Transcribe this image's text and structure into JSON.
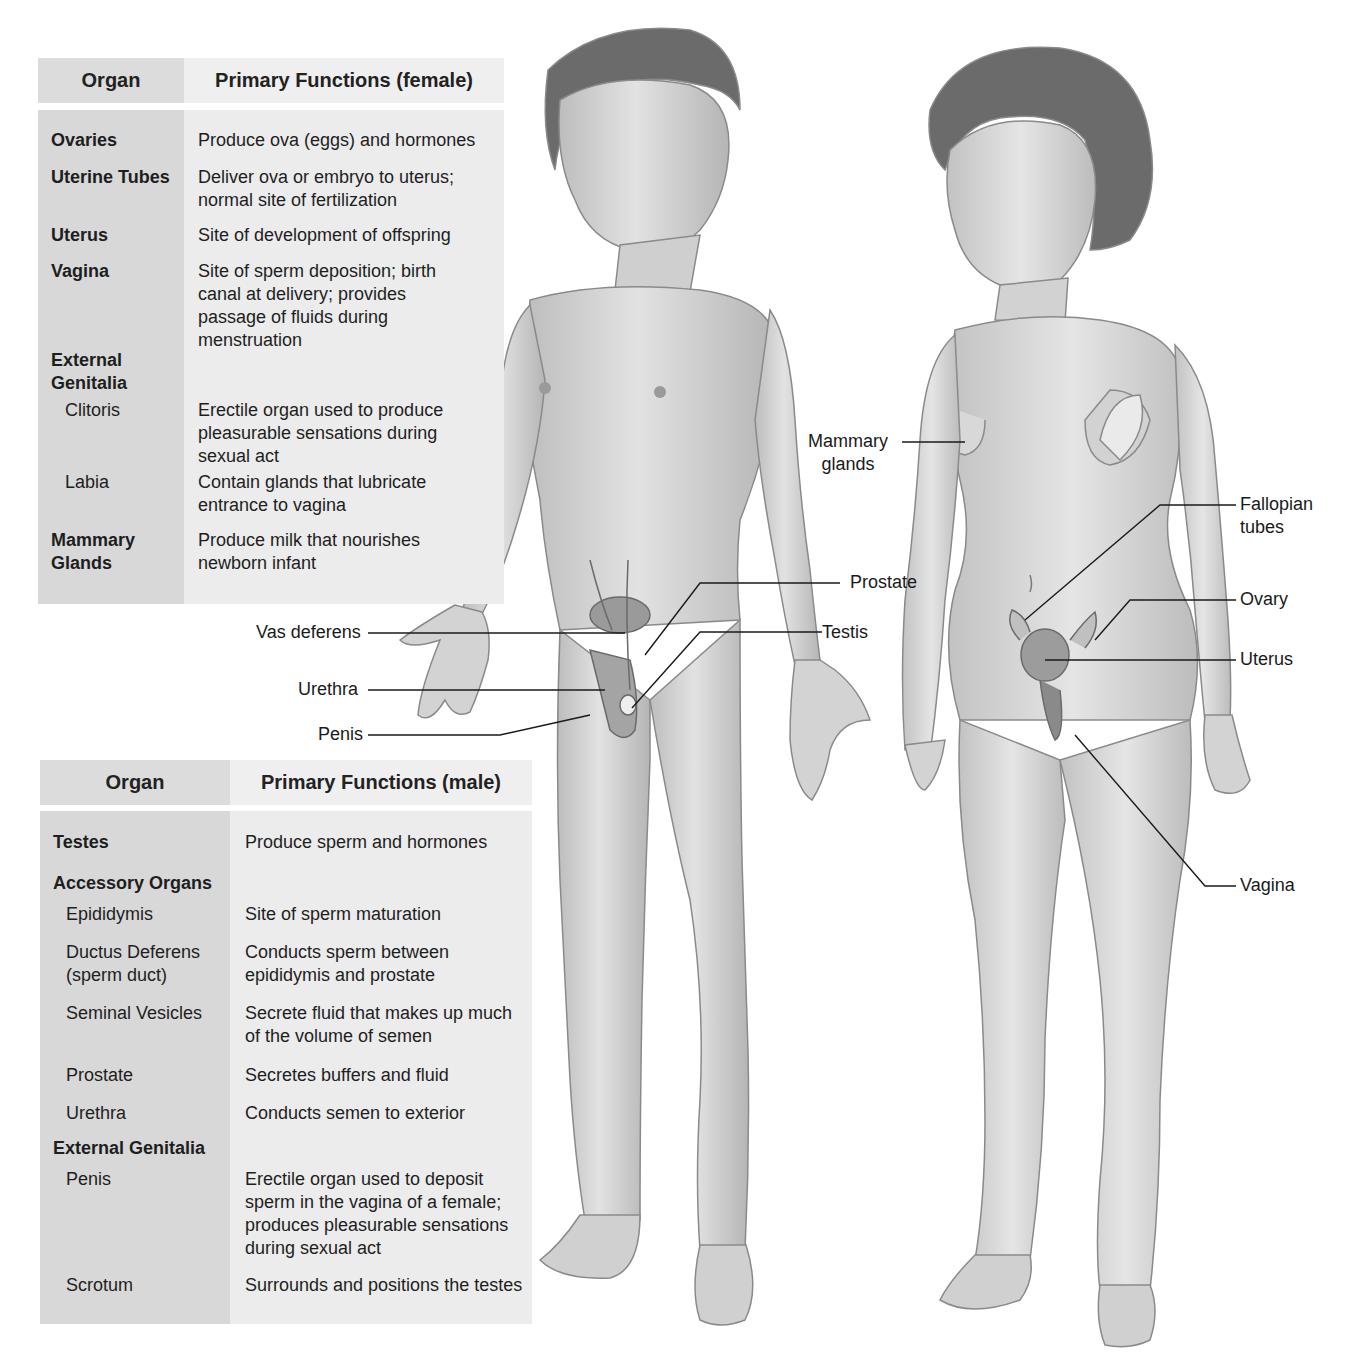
{
  "female_table": {
    "header": {
      "organ": "Organ",
      "function": "Primary Functions (female)"
    },
    "rows": [
      {
        "organ": "Ovaries",
        "function": "Produce ova (eggs) and hormones",
        "bold": true
      },
      {
        "organ": "Uterine Tubes",
        "function": "Deliver ova or embryo to uterus;\n normal site of fertilization",
        "bold": true
      },
      {
        "organ": "Uterus",
        "function": "Site of development of offspring",
        "bold": true
      },
      {
        "organ": "Vagina",
        "function": "Site of sperm deposition; birth\n canal at delivery; provides\n passage of fluids during\n menstruation",
        "bold": true
      },
      {
        "organ": "External\nGenitalia",
        "function": "",
        "bold": true
      },
      {
        "organ": "Clitoris",
        "function": "Erectile organ used to produce\n pleasurable sensations during\n sexual act",
        "bold": false
      },
      {
        "organ": "Labia",
        "function": "Contain glands that lubricate\n entrance to vagina",
        "bold": false
      },
      {
        "organ": "Mammary\nGlands",
        "function": "Produce milk that nourishes\n newborn infant",
        "bold": true
      }
    ]
  },
  "male_table": {
    "header": {
      "organ": "Organ",
      "function": "Primary Functions (male)"
    },
    "rows": [
      {
        "organ": "Testes",
        "function": "Produce sperm and hormones",
        "bold": true
      },
      {
        "organ": "Accessory Organs",
        "function": "",
        "bold": true
      },
      {
        "organ": "Epididymis",
        "function": "Site of sperm maturation",
        "bold": false
      },
      {
        "organ": "Ductus Deferens\n (sperm duct)",
        "function": "Conducts sperm between\n epididymis and prostate",
        "bold": false
      },
      {
        "organ": "Seminal Vesicles",
        "function": "Secrete fluid that makes up much\n of the volume of semen",
        "bold": false
      },
      {
        "organ": "Prostate",
        "function": "Secretes buffers and fluid",
        "bold": false
      },
      {
        "organ": "Urethra",
        "function": "Conducts semen to exterior",
        "bold": false
      },
      {
        "organ": "External Genitalia",
        "function": "",
        "bold": true
      },
      {
        "organ": "Penis",
        "function": "Erectile organ used to deposit\n sperm in the vagina of a female;\n produces pleasurable sensations\n during sexual act",
        "bold": false
      },
      {
        "organ": "Scrotum",
        "function": "Surrounds and positions the testes",
        "bold": false
      }
    ]
  },
  "male_figure": {
    "labels": {
      "vas_deferens": "Vas deferens",
      "urethra": "Urethra",
      "penis": "Penis",
      "prostate": "Prostate",
      "testis": "Testis"
    }
  },
  "female_figure": {
    "labels": {
      "mammary_glands": "Mammary\nglands",
      "fallopian_tubes": "Fallopian\ntubes",
      "ovary": "Ovary",
      "uterus": "Uterus",
      "vagina": "Vagina"
    }
  },
  "colors": {
    "skin": "#d9d9d9",
    "skin_shadow": "#a9a9a9",
    "hair": "#6b6b6b",
    "organ": "#9a9a9a",
    "leader_line": "#1a1a1a"
  }
}
